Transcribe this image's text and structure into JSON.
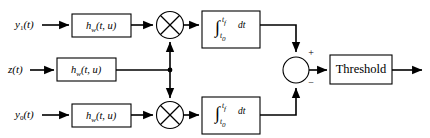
{
  "diagram": {
    "type": "signal-flow-block-diagram",
    "background_color": "#ffffff",
    "line_color": "#000000",
    "inputs": [
      {
        "id": "y1",
        "label_main": "y",
        "label_sub": "1",
        "label_tail": "(t)",
        "full": "y1(t)",
        "row": "top"
      },
      {
        "id": "z",
        "label_main": "z",
        "label_sub": "",
        "label_tail": "(t)",
        "full": "z(t)",
        "row": "middle"
      },
      {
        "id": "y0",
        "label_main": "y",
        "label_sub": "0",
        "label_tail": "(t)",
        "full": "y0(t)",
        "row": "bottom"
      }
    ],
    "filters": [
      {
        "id": "filter-top",
        "label_main": "h",
        "label_sub": "w",
        "label_tail": "(t, u)",
        "full": "hw(t, u)",
        "row": "top"
      },
      {
        "id": "filter-middle",
        "label_main": "h",
        "label_sub": "w",
        "label_tail": "(t, u)",
        "full": "hw(t, u)",
        "row": "middle"
      },
      {
        "id": "filter-bottom",
        "label_main": "h",
        "label_sub": "w",
        "label_tail": "(t, u)",
        "full": "hw(t, u)",
        "row": "bottom"
      }
    ],
    "multipliers": [
      {
        "id": "multiplier-top",
        "glyph": "circle-x",
        "row": "top"
      },
      {
        "id": "multiplier-bottom",
        "glyph": "circle-x",
        "row": "bottom"
      }
    ],
    "integrators": [
      {
        "id": "integrator-top",
        "symbol": "∫",
        "upper_limit_main": "t",
        "upper_limit_sub": "f",
        "lower_limit_main": "t",
        "lower_limit_sub": "0",
        "differential": "dt",
        "full": "∫ from t0 to tf dt",
        "row": "top"
      },
      {
        "id": "integrator-bottom",
        "symbol": "∫",
        "upper_limit_main": "t",
        "upper_limit_sub": "f",
        "lower_limit_main": "t",
        "lower_limit_sub": "0",
        "differential": "dt",
        "full": "∫ from t0 to tf dt",
        "row": "bottom"
      }
    ],
    "summing_junction": {
      "id": "summing-junction",
      "glyph": "circle",
      "plus_sign": "+",
      "minus_sign": "−",
      "plus_input_from": "integrator-top",
      "minus_input_from": "integrator-bottom"
    },
    "threshold_block": {
      "id": "threshold-block",
      "label": "Threshold"
    },
    "output": {
      "id": "output-arrow",
      "label": ""
    },
    "junction_dot": {
      "id": "branch-node",
      "description": "z(t) branch point feeding both multipliers"
    }
  }
}
